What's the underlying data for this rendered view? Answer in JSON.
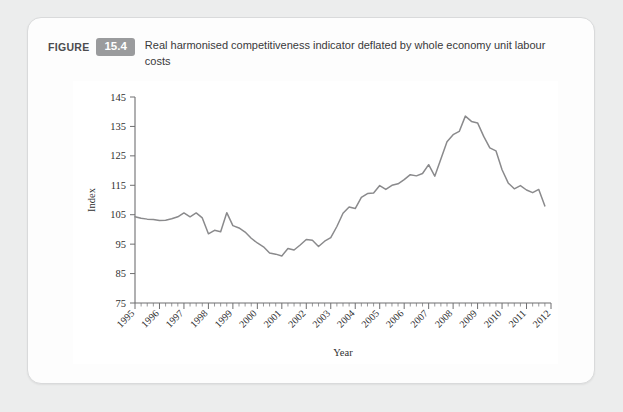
{
  "figure": {
    "label": "FIGURE",
    "number": "15.4",
    "caption": "Real harmonised competitiveness indicator deflated by whole economy unit labour costs"
  },
  "colors": {
    "page_background": "#eceded",
    "card_background": "#fdfdfd",
    "card_border": "#d9dadb",
    "badge_background": "#9a9b9d",
    "badge_text": "#ffffff",
    "line": "#8a8a8c",
    "axis": "#6f6f71",
    "plot_background": "#ffffff"
  },
  "chart_data": {
    "type": "line",
    "title": "Real harmonised competitiveness indicator deflated by whole economy unit labour costs",
    "xlabel": "Year",
    "ylabel": "Index",
    "xlim": [
      1995,
      2012
    ],
    "ylim": [
      75,
      145
    ],
    "yticks": [
      75,
      85,
      95,
      105,
      115,
      125,
      135,
      145
    ],
    "xticks": [
      1995,
      1996,
      1997,
      1998,
      1999,
      2000,
      2001,
      2002,
      2003,
      2004,
      2005,
      2006,
      2007,
      2008,
      2009,
      2010,
      2011,
      2012
    ],
    "x_tick_rotation_deg": 45,
    "minor_ticks_per_year": 4,
    "grid": false,
    "legend": false,
    "series": [
      {
        "name": "Real harmonised competitiveness indicator",
        "x": [
          1995.0,
          1995.25,
          1995.5,
          1995.75,
          1996.0,
          1996.25,
          1996.5,
          1996.75,
          1997.0,
          1997.25,
          1997.5,
          1997.75,
          1998.0,
          1998.25,
          1998.5,
          1998.75,
          1999.0,
          1999.25,
          1999.5,
          1999.75,
          2000.0,
          2000.25,
          2000.5,
          2000.75,
          2001.0,
          2001.25,
          2001.5,
          2001.75,
          2002.0,
          2002.25,
          2002.5,
          2002.75,
          2003.0,
          2003.25,
          2003.5,
          2003.75,
          2004.0,
          2004.25,
          2004.5,
          2004.75,
          2005.0,
          2005.25,
          2005.5,
          2005.75,
          2006.0,
          2006.25,
          2006.5,
          2006.75,
          2007.0,
          2007.25,
          2007.5,
          2007.75,
          2008.0,
          2008.25,
          2008.5,
          2008.75,
          2009.0,
          2009.25,
          2009.5,
          2009.75,
          2010.0,
          2010.25,
          2010.5,
          2010.75,
          2011.0,
          2011.25,
          2011.5,
          2011.75
        ],
        "values": [
          104.3,
          103.8,
          103.5,
          103.4,
          103.0,
          103.1,
          103.6,
          104.3,
          105.6,
          104.3,
          105.6,
          103.9,
          98.5,
          99.7,
          99.2,
          105.7,
          101.3,
          100.5,
          99.1,
          97.0,
          95.4,
          94.1,
          92.0,
          91.6,
          91.0,
          93.5,
          93.0,
          94.7,
          96.6,
          96.3,
          94.2,
          96.0,
          97.2,
          101.0,
          105.5,
          107.6,
          107.1,
          110.9,
          112.2,
          112.4,
          114.9,
          113.6,
          115.0,
          115.5,
          116.9,
          118.6,
          118.2,
          119.0,
          122.0,
          118.1,
          123.9,
          129.8,
          132.2,
          133.3,
          138.5,
          136.7,
          136.2,
          131.6,
          127.7,
          126.7,
          120.3,
          115.8,
          113.8,
          114.9,
          113.4,
          112.5,
          113.6,
          108.0
        ]
      }
    ],
    "notes": {
      "peak_value": 138.5,
      "peak_year": "2008",
      "trough_value": 91.0,
      "trough_year": "2001",
      "start_value": 104.3,
      "end_value": 108.0
    }
  }
}
